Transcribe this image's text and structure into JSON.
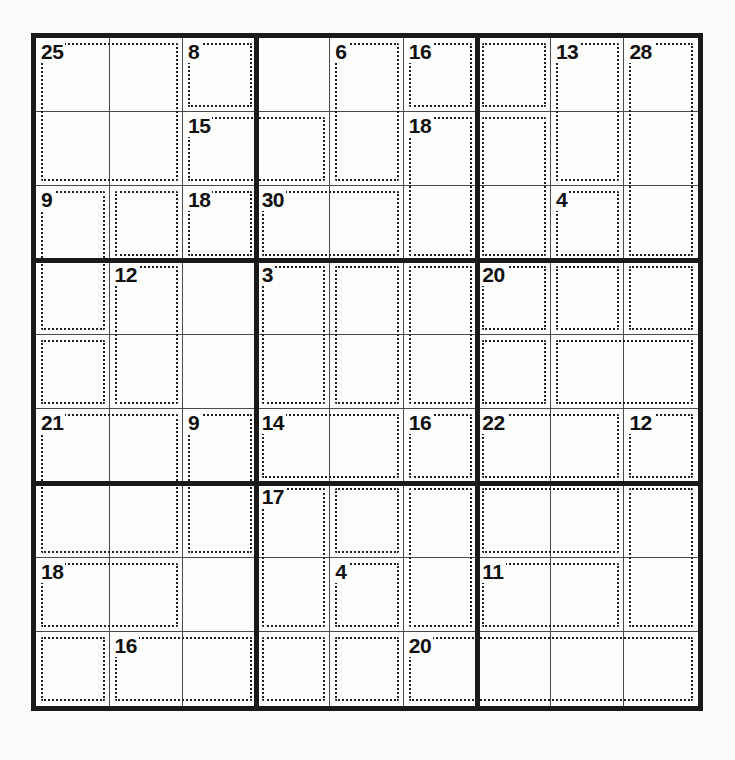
{
  "puzzle": {
    "type": "killer-sudoku",
    "grid_size": 9,
    "block_size": 3,
    "cell_px": 74.5,
    "given_digits": [],
    "colors": {
      "frame": "#1a1a1a",
      "cell_line": "#4a4a4a",
      "cage_outline": "#202020",
      "sum_text": "#111111",
      "paper": "#fbfbfa"
    },
    "cages": [
      {
        "id": "c1",
        "sum": "25",
        "anchor": {
          "r": 0,
          "c": 0
        },
        "cells": [
          [
            0,
            0
          ],
          [
            0,
            1
          ],
          [
            1,
            0
          ],
          [
            1,
            1
          ]
        ]
      },
      {
        "id": "c2",
        "sum": "8",
        "anchor": {
          "r": 0,
          "c": 2
        },
        "cells": [
          [
            0,
            2
          ]
        ]
      },
      {
        "id": "c3",
        "sum": "6",
        "anchor": {
          "r": 0,
          "c": 4
        },
        "cells": [
          [
            0,
            4
          ],
          [
            1,
            4
          ]
        ]
      },
      {
        "id": "c4",
        "sum": "16",
        "anchor": {
          "r": 0,
          "c": 5
        },
        "cells": [
          [
            0,
            5
          ]
        ]
      },
      {
        "id": "c5",
        "sum": "13",
        "anchor": {
          "r": 0,
          "c": 7
        },
        "cells": [
          [
            0,
            7
          ],
          [
            1,
            7
          ]
        ]
      },
      {
        "id": "c6",
        "sum": "28",
        "anchor": {
          "r": 0,
          "c": 8
        },
        "cells": [
          [
            0,
            8
          ],
          [
            1,
            8
          ],
          [
            2,
            8
          ]
        ]
      },
      {
        "id": "c7",
        "sum": "15",
        "anchor": {
          "r": 1,
          "c": 2
        },
        "cells": [
          [
            1,
            2
          ],
          [
            1,
            3
          ]
        ]
      },
      {
        "id": "c8",
        "sum": "18",
        "anchor": {
          "r": 1,
          "c": 5
        },
        "cells": [
          [
            1,
            5
          ],
          [
            2,
            5
          ]
        ]
      },
      {
        "id": "c9",
        "sum": "9",
        "anchor": {
          "r": 2,
          "c": 0
        },
        "cells": [
          [
            2,
            0
          ],
          [
            3,
            0
          ]
        ]
      },
      {
        "id": "c10",
        "sum": "18",
        "anchor": {
          "r": 2,
          "c": 2
        },
        "cells": [
          [
            2,
            2
          ]
        ]
      },
      {
        "id": "c11",
        "sum": "30",
        "anchor": {
          "r": 2,
          "c": 3
        },
        "cells": [
          [
            2,
            3
          ],
          [
            2,
            4
          ]
        ]
      },
      {
        "id": "c12",
        "sum": "4",
        "anchor": {
          "r": 2,
          "c": 7
        },
        "cells": [
          [
            2,
            7
          ],
          [
            3,
            7
          ],
          [
            3,
            8
          ]
        ]
      },
      {
        "id": "c13",
        "sum": "12",
        "anchor": {
          "r": 3,
          "c": 1
        },
        "cells": [
          [
            3,
            1
          ],
          [
            4,
            1
          ]
        ]
      },
      {
        "id": "c14",
        "sum": "3",
        "anchor": {
          "r": 3,
          "c": 3
        },
        "cells": [
          [
            3,
            3
          ],
          [
            4,
            3
          ]
        ]
      },
      {
        "id": "c15",
        "sum": "20",
        "anchor": {
          "r": 3,
          "c": 6
        },
        "cells": [
          [
            3,
            6
          ],
          [
            4,
            6
          ]
        ]
      },
      {
        "id": "c16",
        "sum": "21",
        "anchor": {
          "r": 5,
          "c": 0
        },
        "cells": [
          [
            5,
            0
          ],
          [
            5,
            1
          ],
          [
            6,
            0
          ],
          [
            6,
            1
          ]
        ]
      },
      {
        "id": "c17",
        "sum": "9",
        "anchor": {
          "r": 5,
          "c": 2
        },
        "cells": [
          [
            5,
            2
          ],
          [
            6,
            2
          ]
        ]
      },
      {
        "id": "c18",
        "sum": "14",
        "anchor": {
          "r": 5,
          "c": 3
        },
        "cells": [
          [
            5,
            3
          ],
          [
            5,
            4
          ]
        ]
      },
      {
        "id": "c19",
        "sum": "16",
        "anchor": {
          "r": 5,
          "c": 5
        },
        "cells": [
          [
            5,
            5
          ]
        ]
      },
      {
        "id": "c20",
        "sum": "22",
        "anchor": {
          "r": 5,
          "c": 6
        },
        "cells": [
          [
            5,
            6
          ],
          [
            5,
            7
          ]
        ]
      },
      {
        "id": "c21",
        "sum": "12",
        "anchor": {
          "r": 5,
          "c": 8
        },
        "cells": [
          [
            5,
            8
          ]
        ]
      },
      {
        "id": "c22",
        "sum": "17",
        "anchor": {
          "r": 6,
          "c": 3
        },
        "cells": [
          [
            6,
            3
          ],
          [
            7,
            3
          ]
        ]
      },
      {
        "id": "c23",
        "sum": "4",
        "anchor": {
          "r": 7,
          "c": 4
        },
        "cells": [
          [
            7,
            4
          ]
        ]
      },
      {
        "id": "c24",
        "sum": "18",
        "anchor": {
          "r": 7,
          "c": 0
        },
        "cells": [
          [
            7,
            0
          ],
          [
            7,
            1
          ]
        ]
      },
      {
        "id": "c25",
        "sum": "11",
        "anchor": {
          "r": 7,
          "c": 6
        },
        "cells": [
          [
            7,
            6
          ],
          [
            7,
            7
          ]
        ]
      },
      {
        "id": "c26",
        "sum": "16",
        "anchor": {
          "r": 8,
          "c": 1
        },
        "cells": [
          [
            8,
            1
          ],
          [
            8,
            2
          ]
        ]
      },
      {
        "id": "c27",
        "sum": "20",
        "anchor": {
          "r": 8,
          "c": 5
        },
        "cells": [
          [
            8,
            5
          ]
        ]
      }
    ],
    "cage_outlines": [
      {
        "name": "cage-25",
        "r": 0,
        "c": 0,
        "rows": 2,
        "cols": 2
      },
      {
        "name": "cage-8",
        "r": 0,
        "c": 2,
        "rows": 1,
        "cols": 1
      },
      {
        "name": "cage-6",
        "r": 0,
        "c": 4,
        "rows": 2,
        "cols": 1
      },
      {
        "name": "cage-16-top",
        "r": 0,
        "c": 5,
        "rows": 1,
        "cols": 1
      },
      {
        "name": "cage-col7-a",
        "r": 0,
        "c": 6,
        "rows": 1,
        "cols": 1
      },
      {
        "name": "cage-13",
        "r": 0,
        "c": 7,
        "rows": 2,
        "cols": 1
      },
      {
        "name": "cage-28",
        "r": 0,
        "c": 8,
        "rows": 3,
        "cols": 1
      },
      {
        "name": "cage-15",
        "r": 1,
        "c": 2,
        "rows": 1,
        "cols": 2
      },
      {
        "name": "cage-18-r2c6",
        "r": 1,
        "c": 5,
        "rows": 2,
        "cols": 1
      },
      {
        "name": "cage-col7-b",
        "r": 1,
        "c": 6,
        "rows": 2,
        "cols": 1
      },
      {
        "name": "cage-9-left",
        "r": 2,
        "c": 0,
        "rows": 2,
        "cols": 1
      },
      {
        "name": "cage-r3c2",
        "r": 2,
        "c": 1,
        "rows": 1,
        "cols": 1
      },
      {
        "name": "cage-18-r3c3",
        "r": 2,
        "c": 2,
        "rows": 1,
        "cols": 1
      },
      {
        "name": "cage-30",
        "r": 2,
        "c": 3,
        "rows": 1,
        "cols": 2
      },
      {
        "name": "cage-4-top",
        "r": 2,
        "c": 7,
        "rows": 1,
        "cols": 1
      },
      {
        "name": "cage-12-mid",
        "r": 3,
        "c": 1,
        "rows": 2,
        "cols": 1
      },
      {
        "name": "cage-3",
        "r": 3,
        "c": 3,
        "rows": 2,
        "cols": 1
      },
      {
        "name": "cage-c5-mid",
        "r": 3,
        "c": 4,
        "rows": 2,
        "cols": 1
      },
      {
        "name": "cage-c6-mid",
        "r": 3,
        "c": 5,
        "rows": 2,
        "cols": 1
      },
      {
        "name": "cage-20",
        "r": 3,
        "c": 6,
        "rows": 1,
        "cols": 1
      },
      {
        "name": "cage-r4c8",
        "r": 3,
        "c": 7,
        "rows": 1,
        "cols": 1
      },
      {
        "name": "cage-r4c9",
        "r": 3,
        "c": 8,
        "rows": 1,
        "cols": 1
      },
      {
        "name": "cage-r5c1",
        "r": 4,
        "c": 0,
        "rows": 1,
        "cols": 1
      },
      {
        "name": "cage-r5c7",
        "r": 4,
        "c": 6,
        "rows": 1,
        "cols": 1
      },
      {
        "name": "cage-r5c89",
        "r": 4,
        "c": 7,
        "rows": 1,
        "cols": 2
      },
      {
        "name": "cage-21",
        "r": 5,
        "c": 0,
        "rows": 2,
        "cols": 2
      },
      {
        "name": "cage-9-c3",
        "r": 5,
        "c": 2,
        "rows": 2,
        "cols": 1
      },
      {
        "name": "cage-14",
        "r": 5,
        "c": 3,
        "rows": 1,
        "cols": 2
      },
      {
        "name": "cage-16-r6c6",
        "r": 5,
        "c": 5,
        "rows": 1,
        "cols": 1
      },
      {
        "name": "cage-22",
        "r": 5,
        "c": 6,
        "rows": 1,
        "cols": 2
      },
      {
        "name": "cage-12-r6c9",
        "r": 5,
        "c": 8,
        "rows": 1,
        "cols": 1
      },
      {
        "name": "cage-17",
        "r": 6,
        "c": 3,
        "rows": 2,
        "cols": 1
      },
      {
        "name": "cage-r7c5",
        "r": 6,
        "c": 4,
        "rows": 1,
        "cols": 1
      },
      {
        "name": "cage-r7c6",
        "r": 6,
        "c": 5,
        "rows": 2,
        "cols": 1
      },
      {
        "name": "cage-r7c78",
        "r": 6,
        "c": 6,
        "rows": 1,
        "cols": 2
      },
      {
        "name": "cage-r7c9",
        "r": 6,
        "c": 8,
        "rows": 2,
        "cols": 1
      },
      {
        "name": "cage-18-low",
        "r": 7,
        "c": 0,
        "rows": 1,
        "cols": 2
      },
      {
        "name": "cage-4-low",
        "r": 7,
        "c": 4,
        "rows": 1,
        "cols": 1
      },
      {
        "name": "cage-11",
        "r": 7,
        "c": 6,
        "rows": 1,
        "cols": 2
      },
      {
        "name": "cage-r9c1",
        "r": 8,
        "c": 0,
        "rows": 1,
        "cols": 1
      },
      {
        "name": "cage-16-low",
        "r": 8,
        "c": 1,
        "rows": 1,
        "cols": 2
      },
      {
        "name": "cage-r9c45",
        "r": 8,
        "c": 3,
        "rows": 1,
        "cols": 1
      },
      {
        "name": "cage-r9c5",
        "r": 8,
        "c": 4,
        "rows": 1,
        "cols": 1
      },
      {
        "name": "cage-20-low",
        "r": 8,
        "c": 5,
        "rows": 1,
        "cols": 4
      }
    ]
  }
}
